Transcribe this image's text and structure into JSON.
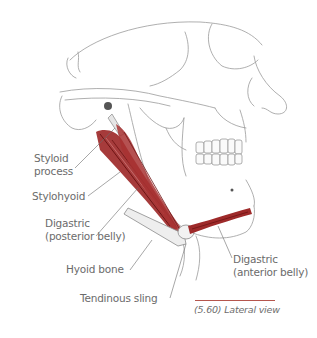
{
  "figure": {
    "view": "Lateral view of skull showing suprahyoid muscles",
    "colors": {
      "muscle": "#9e2a2a",
      "muscle_dark": "#6e1414",
      "bone_line": "#8a8a8a",
      "label_text": "#6b6b6b",
      "caption_rule": "#b5564d"
    }
  },
  "labels": [
    {
      "id": "styloid",
      "text_line1": "Styloid",
      "text_line2": "process"
    },
    {
      "id": "stylohyoid",
      "text_line1": "Stylohyoid"
    },
    {
      "id": "digastric_posterior",
      "text_line1": "Digastric",
      "text_line2": "(posterior belly)"
    },
    {
      "id": "hyoid",
      "text_line1": "Hyoid bone"
    },
    {
      "id": "tendinous_sling",
      "text_line1": "Tendinous sling"
    },
    {
      "id": "digastric_anterior",
      "text_line1": "Digastric",
      "text_line2": "(anterior belly)"
    }
  ],
  "caption": {
    "text": "(5.60) Lateral view"
  }
}
